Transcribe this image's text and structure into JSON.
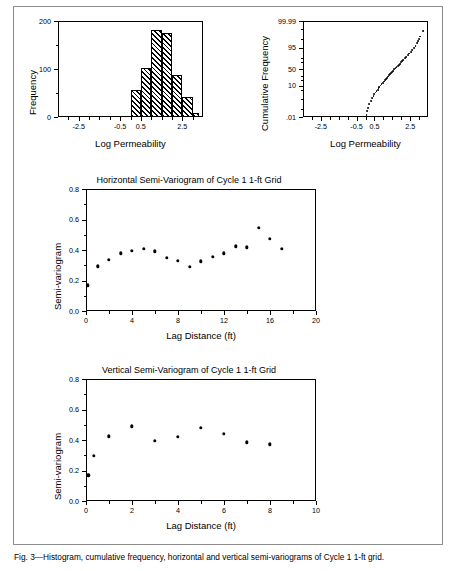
{
  "figure": {
    "caption": "Fig. 3—Histogram, cumulative frequency, horizontal and vertical semi-variograms of Cycle 1 1-ft grid."
  },
  "charts": {
    "histogram": {
      "title": "",
      "xlabel": "Log Permeability",
      "ylabel": "Frequency",
      "xticks": [
        -2.5,
        -0.5,
        0.5,
        2.5
      ],
      "xtick_labels": [
        "-2.5",
        "-0.5",
        "0.5",
        "2.5"
      ],
      "yticks": [
        0,
        100,
        200
      ],
      "ytick_labels": [
        "0",
        "100",
        "200"
      ],
      "xlim": [
        -3.5,
        3.5
      ],
      "ylim": [
        0,
        200
      ],
      "minor_x": [
        -3.0,
        -2.0,
        -1.5,
        -1.0,
        0.0,
        1.0,
        1.5,
        2.0,
        3.0
      ],
      "minor_y": [
        50,
        150
      ],
      "bin_width": 0.5,
      "bars": [
        {
          "left": 0.0,
          "right": 0.5,
          "value": 56
        },
        {
          "left": 0.5,
          "right": 1.0,
          "value": 103
        },
        {
          "left": 1.0,
          "right": 1.5,
          "value": 181
        },
        {
          "left": 1.5,
          "right": 2.0,
          "value": 175
        },
        {
          "left": 2.0,
          "right": 2.5,
          "value": 88
        },
        {
          "left": 2.5,
          "right": 3.0,
          "value": 41
        },
        {
          "left": 3.0,
          "right": 3.3,
          "value": 8
        }
      ]
    },
    "probability": {
      "title": "",
      "xlabel": "Log Permeability",
      "ylabel": "Cumulative Frequency",
      "xticks": [
        -2.5,
        -0.5,
        0.5,
        2.5
      ],
      "xtick_labels": [
        "-2.5",
        "-0.5",
        "0.5",
        "2.5"
      ],
      "ytick_labels": [
        "99.99",
        "95",
        "50",
        "10",
        ".01"
      ],
      "ytick_values": [
        99.99,
        95,
        50,
        10,
        0.01
      ],
      "xlim": [
        -3.5,
        3.5
      ],
      "points": [
        {
          "x": 0.06,
          "p": 0.02
        },
        {
          "x": 0.08,
          "p": 0.05
        },
        {
          "x": 0.12,
          "p": 0.12
        },
        {
          "x": 0.2,
          "p": 0.3
        },
        {
          "x": 0.3,
          "p": 0.7
        },
        {
          "x": 0.38,
          "p": 1.2
        },
        {
          "x": 0.45,
          "p": 1.8
        },
        {
          "x": 0.5,
          "p": 2.5
        },
        {
          "x": 0.56,
          "p": 3.4
        },
        {
          "x": 0.62,
          "p": 4.4
        },
        {
          "x": 0.68,
          "p": 5.5
        },
        {
          "x": 0.73,
          "p": 6.8
        },
        {
          "x": 0.78,
          "p": 8.2
        },
        {
          "x": 0.84,
          "p": 10.0
        },
        {
          "x": 0.9,
          "p": 12.0
        },
        {
          "x": 0.96,
          "p": 14.0
        },
        {
          "x": 1.02,
          "p": 16.5
        },
        {
          "x": 1.08,
          "p": 19.0
        },
        {
          "x": 1.14,
          "p": 22.0
        },
        {
          "x": 1.2,
          "p": 25.0
        },
        {
          "x": 1.26,
          "p": 28.0
        },
        {
          "x": 1.32,
          "p": 31.0
        },
        {
          "x": 1.38,
          "p": 34.5
        },
        {
          "x": 1.44,
          "p": 38.0
        },
        {
          "x": 1.5,
          "p": 41.5
        },
        {
          "x": 1.56,
          "p": 45.0
        },
        {
          "x": 1.62,
          "p": 48.5
        },
        {
          "x": 1.68,
          "p": 52.0
        },
        {
          "x": 1.74,
          "p": 55.5
        },
        {
          "x": 1.8,
          "p": 59.0
        },
        {
          "x": 1.86,
          "p": 62.5
        },
        {
          "x": 1.92,
          "p": 66.0
        },
        {
          "x": 1.98,
          "p": 69.5
        },
        {
          "x": 2.05,
          "p": 73.0
        },
        {
          "x": 2.12,
          "p": 76.5
        },
        {
          "x": 2.2,
          "p": 80.0
        },
        {
          "x": 2.28,
          "p": 83.0
        },
        {
          "x": 2.36,
          "p": 86.0
        },
        {
          "x": 2.45,
          "p": 88.5
        },
        {
          "x": 2.54,
          "p": 91.0
        },
        {
          "x": 2.63,
          "p": 93.0
        },
        {
          "x": 2.72,
          "p": 95.0
        },
        {
          "x": 2.8,
          "p": 96.5
        },
        {
          "x": 2.88,
          "p": 97.6
        },
        {
          "x": 2.95,
          "p": 98.4
        },
        {
          "x": 3.0,
          "p": 99.0
        },
        {
          "x": 3.05,
          "p": 99.4
        },
        {
          "x": 3.2,
          "p": 99.85
        }
      ]
    },
    "horizontal_variogram": {
      "title": "Horizontal Semi-Variogram of Cycle 1 1-ft Grid",
      "xlabel": "Lag Distance (ft)",
      "ylabel": "Semi-variogram",
      "xticks": [
        0,
        4,
        8,
        12,
        16,
        20
      ],
      "xtick_labels": [
        "0",
        "4",
        "8",
        "12",
        "16",
        "20"
      ],
      "yticks": [
        0.0,
        0.2,
        0.4,
        0.6,
        0.8
      ],
      "ytick_labels": [
        "0.0",
        "0.2",
        "0.4",
        "0.6",
        "0.8"
      ],
      "xlim": [
        0,
        20
      ],
      "ylim": [
        0,
        0.8
      ],
      "minor_x": [
        2,
        6,
        10,
        14,
        18
      ],
      "minor_y": [
        0.1,
        0.3,
        0.5,
        0.7
      ],
      "points": [
        {
          "x": 0.15,
          "y": 0.168
        },
        {
          "x": 1.0,
          "y": 0.293
        },
        {
          "x": 2.0,
          "y": 0.334
        },
        {
          "x": 3.0,
          "y": 0.378
        },
        {
          "x": 4.0,
          "y": 0.394
        },
        {
          "x": 5.0,
          "y": 0.406
        },
        {
          "x": 6.0,
          "y": 0.392
        },
        {
          "x": 7.0,
          "y": 0.348
        },
        {
          "x": 8.0,
          "y": 0.33
        },
        {
          "x": 9.0,
          "y": 0.288
        },
        {
          "x": 10.0,
          "y": 0.325
        },
        {
          "x": 11.0,
          "y": 0.357
        },
        {
          "x": 12.0,
          "y": 0.378
        },
        {
          "x": 13.0,
          "y": 0.423
        },
        {
          "x": 14.0,
          "y": 0.417
        },
        {
          "x": 15.0,
          "y": 0.546
        },
        {
          "x": 16.0,
          "y": 0.472
        },
        {
          "x": 17.0,
          "y": 0.408
        }
      ]
    },
    "vertical_variogram": {
      "title": "Vertical Semi-Variogram of Cycle 1 1-ft Grid",
      "xlabel": "Lag Distance (ft)",
      "ylabel": "Semi-variogram",
      "xticks": [
        0,
        2,
        4,
        6,
        8,
        10
      ],
      "xtick_labels": [
        "0",
        "2",
        "4",
        "6",
        "8",
        "10"
      ],
      "yticks": [
        0.0,
        0.2,
        0.4,
        0.6,
        0.8
      ],
      "ytick_labels": [
        "0.0",
        "0.2",
        "0.4",
        "0.6",
        "0.8"
      ],
      "xlim": [
        0,
        10
      ],
      "ylim": [
        0,
        0.8
      ],
      "minor_x": [
        1,
        3,
        5,
        7,
        9
      ],
      "minor_y": [
        0.1,
        0.3,
        0.5,
        0.7
      ],
      "points": [
        {
          "x": 0.1,
          "y": 0.168
        },
        {
          "x": 0.35,
          "y": 0.297
        },
        {
          "x": 1.0,
          "y": 0.425
        },
        {
          "x": 2.0,
          "y": 0.49
        },
        {
          "x": 3.0,
          "y": 0.393
        },
        {
          "x": 4.0,
          "y": 0.419
        },
        {
          "x": 5.0,
          "y": 0.478
        },
        {
          "x": 6.0,
          "y": 0.44
        },
        {
          "x": 7.0,
          "y": 0.385
        },
        {
          "x": 8.0,
          "y": 0.372
        }
      ]
    }
  },
  "chart_data": [
    {
      "type": "bar",
      "title": "Histogram of Log Permeability",
      "xlabel": "Log Permeability",
      "ylabel": "Frequency",
      "categories": [
        "0.0-0.5",
        "0.5-1.0",
        "1.0-1.5",
        "1.5-2.0",
        "2.0-2.5",
        "2.5-3.0",
        "3.0-3.3"
      ],
      "values": [
        56,
        103,
        181,
        175,
        88,
        41,
        8
      ],
      "xlim": [
        -3.5,
        3.5
      ],
      "ylim": [
        0,
        200
      ],
      "grid": false,
      "legend": "none"
    },
    {
      "type": "scatter",
      "title": "Cumulative Frequency (Normal Probability Plot)",
      "xlabel": "Log Permeability",
      "ylabel": "Cumulative Frequency",
      "x": [
        0.06,
        0.08,
        0.12,
        0.2,
        0.3,
        0.38,
        0.45,
        0.5,
        0.56,
        0.62,
        0.68,
        0.73,
        0.78,
        0.84,
        0.9,
        0.96,
        1.02,
        1.08,
        1.14,
        1.2,
        1.26,
        1.32,
        1.38,
        1.44,
        1.5,
        1.56,
        1.62,
        1.68,
        1.74,
        1.8,
        1.86,
        1.92,
        1.98,
        2.05,
        2.12,
        2.2,
        2.28,
        2.36,
        2.45,
        2.54,
        2.63,
        2.72,
        2.8,
        2.88,
        2.95,
        3.0,
        3.05,
        3.2
      ],
      "y": [
        0.02,
        0.05,
        0.12,
        0.3,
        0.7,
        1.2,
        1.8,
        2.5,
        3.4,
        4.4,
        5.5,
        6.8,
        8.2,
        10.0,
        12.0,
        14.0,
        16.5,
        19.0,
        22.0,
        25.0,
        28.0,
        31.0,
        34.5,
        38.0,
        41.5,
        45.0,
        48.5,
        52.0,
        55.5,
        59.0,
        62.5,
        66.0,
        69.5,
        73.0,
        76.5,
        80.0,
        83.0,
        86.0,
        88.5,
        91.0,
        93.0,
        95.0,
        96.5,
        97.6,
        98.4,
        99.0,
        99.4,
        99.85
      ],
      "xlim": [
        -3.5,
        3.5
      ],
      "ylim": [
        0.01,
        99.99
      ],
      "yscale": "probability",
      "grid": false,
      "legend": "none"
    },
    {
      "type": "scatter",
      "title": "Horizontal Semi-Variogram of Cycle 1 1-ft Grid",
      "xlabel": "Lag Distance (ft)",
      "ylabel": "Semi-variogram",
      "x": [
        0.15,
        1,
        2,
        3,
        4,
        5,
        6,
        7,
        8,
        9,
        10,
        11,
        12,
        13,
        14,
        15,
        16,
        17
      ],
      "y": [
        0.168,
        0.293,
        0.334,
        0.378,
        0.394,
        0.406,
        0.392,
        0.348,
        0.33,
        0.288,
        0.325,
        0.357,
        0.378,
        0.423,
        0.417,
        0.546,
        0.472,
        0.408
      ],
      "xlim": [
        0,
        20
      ],
      "ylim": [
        0,
        0.8
      ],
      "grid": false,
      "legend": "none"
    },
    {
      "type": "scatter",
      "title": "Vertical Semi-Variogram of Cycle 1 1-ft Grid",
      "xlabel": "Lag Distance (ft)",
      "ylabel": "Semi-variogram",
      "x": [
        0.1,
        0.35,
        1,
        2,
        3,
        4,
        5,
        6,
        7,
        8
      ],
      "y": [
        0.168,
        0.297,
        0.425,
        0.49,
        0.393,
        0.419,
        0.478,
        0.44,
        0.385,
        0.372
      ],
      "xlim": [
        0,
        10
      ],
      "ylim": [
        0,
        0.8
      ],
      "grid": false,
      "legend": "none"
    }
  ]
}
